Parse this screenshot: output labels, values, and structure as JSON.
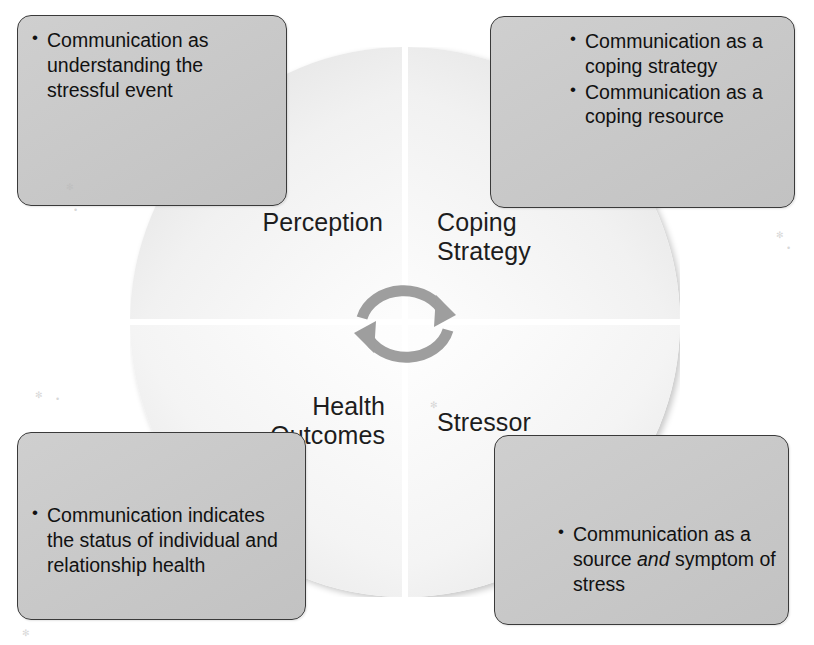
{
  "diagram": {
    "center_icon": "circular-rotation-arrows-icon",
    "colors": {
      "callout_fill": "#c9c9c9",
      "callout_border": "#3a3a3a",
      "quadrant_fill": "#f5f5f5",
      "arrow_gray": "#9a9a9a",
      "text": "#111111"
    },
    "quadrants": [
      {
        "id": "perception",
        "label": "Perception",
        "position": "top-left"
      },
      {
        "id": "coping-strategy",
        "label": "Coping\nStrategy",
        "position": "top-right"
      },
      {
        "id": "health-outcomes",
        "label": "Health\nOutcomes",
        "position": "bottom-left"
      },
      {
        "id": "stressor",
        "label": "Stressor",
        "position": "bottom-right"
      }
    ],
    "callouts": [
      {
        "id": "perception-callout",
        "position": "top-left",
        "bullets": [
          {
            "text": "Communication as understanding the stressful event",
            "italic_word": ""
          }
        ]
      },
      {
        "id": "coping-strategy-callout",
        "position": "top-right",
        "bullets": [
          {
            "text": "Communication as a coping strategy",
            "italic_word": ""
          },
          {
            "text": "Communication as a coping resource",
            "italic_word": ""
          }
        ]
      },
      {
        "id": "health-outcomes-callout",
        "position": "bottom-left",
        "bullets": [
          {
            "text": "Communication indicates the status of individual and relationship health",
            "italic_word": ""
          }
        ]
      },
      {
        "id": "stressor-callout",
        "position": "bottom-right",
        "bullets": [
          {
            "pre": "Communication as a source ",
            "italic_word": "and",
            "post": " symptom of stress"
          }
        ]
      }
    ]
  }
}
